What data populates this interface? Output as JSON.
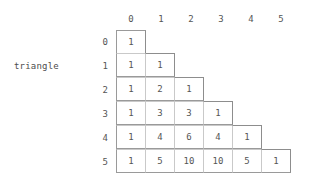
{
  "label": {
    "name": "triangle"
  },
  "table": {
    "column_headers": [
      "0",
      "1",
      "2",
      "3",
      "4",
      "5"
    ],
    "row_headers": [
      "0",
      "1",
      "2",
      "3",
      "4",
      "5"
    ],
    "rows": [
      [
        "1"
      ],
      [
        "1",
        "1"
      ],
      [
        "1",
        "2",
        "1"
      ],
      [
        "1",
        "3",
        "3",
        "1"
      ],
      [
        "1",
        "4",
        "6",
        "4",
        "1"
      ],
      [
        "1",
        "5",
        "10",
        "10",
        "5",
        "1"
      ]
    ]
  },
  "colors": {
    "background": "#ffffff",
    "text": "#555555",
    "grid_line": "#9a9a9a",
    "grid_line_light": "#c9c9c9"
  }
}
